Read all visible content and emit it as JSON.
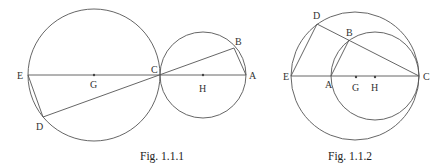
{
  "figures": [
    {
      "caption": "Fig. 1.1.1",
      "labels": {
        "E": "E",
        "G": "G",
        "C": "C",
        "H": "H",
        "A": "A",
        "B": "B",
        "D": "D"
      }
    },
    {
      "caption": "Fig. 1.1.2",
      "labels": {
        "D": "D",
        "B": "B",
        "E": "E",
        "A": "A",
        "G": "G",
        "H": "H",
        "C": "C"
      }
    }
  ]
}
